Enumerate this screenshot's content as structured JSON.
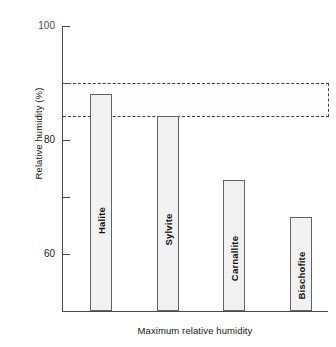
{
  "chart_data": {
    "type": "bar",
    "title": "",
    "subtitle": "",
    "xlabel": "Maximum relative humidity",
    "ylabel": "Relative humidity (%)",
    "categories": [
      "Halite",
      "Sylvite",
      "Carnallite",
      "Bischofite"
    ],
    "values": [
      76,
      68.5,
      46,
      33
    ],
    "ylim": [
      0,
      100
    ],
    "yticks": [
      0,
      20,
      40,
      60,
      80,
      100
    ],
    "ytick_labels": [
      "0",
      "20",
      "40",
      "60",
      "80",
      "100"
    ],
    "xticks": [],
    "grid": false,
    "legend": false,
    "legend_position": "none",
    "bar_label_rotation": -90,
    "annotations": [
      {
        "name": "recommended-humidity-band",
        "type": "shaded-band",
        "orientation": "horizontal",
        "y_min": 68,
        "y_max": 80,
        "style": "stippled-dashed",
        "extends_beyond_axes": true,
        "text": ""
      }
    ],
    "colors": {
      "bar_fill": "#f1f1f1",
      "bar_edge": "#636363",
      "axis": "#4a4a4a",
      "band_fill": "#fdfdfd",
      "band_edge": "#3d3d3d",
      "text": "#1a1a1a",
      "background": "#ffffff"
    }
  }
}
